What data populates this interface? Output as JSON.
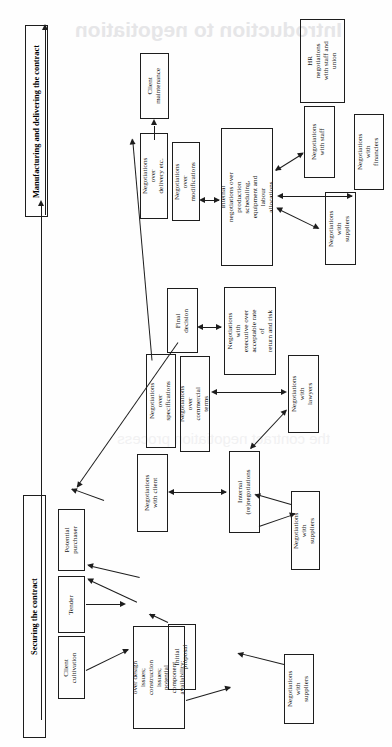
{
  "figure": {
    "orientation": "rotated-90-ccw",
    "watermark_text": "Introduction to negotiation",
    "watermark_text_2": "the contract negotiation process"
  },
  "phases": [
    {
      "id": "securing",
      "label": "Securing the contract"
    },
    {
      "id": "manufacturing",
      "label": "Manufacturing and delivering the contract"
    }
  ],
  "nodes": [
    {
      "id": "client-cultivation",
      "label": "Client\ncultivation"
    },
    {
      "id": "tender",
      "label": "Tender"
    },
    {
      "id": "potential-purchaser",
      "label": "Potential\npurchaser"
    },
    {
      "id": "initial-proposal",
      "label": "Initial\nproposal"
    },
    {
      "id": "internal-neg-design",
      "label": "Internal negotiations\nover design issues;\nconstruction issues;\npotential component\navailability;\nscheduling; price\nestimation"
    },
    {
      "id": "neg-suppliers-bottom",
      "label": "Negotiations\nwith suppliers"
    },
    {
      "id": "neg-with-client",
      "label": "Negotiations\nwith client"
    },
    {
      "id": "internal-renegotiations",
      "label": "Internal\n(re)negotiations"
    },
    {
      "id": "neg-suppliers-mid",
      "label": "Negotiations\nwith suppliers"
    },
    {
      "id": "neg-lawyers",
      "label": "Negotiations\nwith lawyers"
    },
    {
      "id": "neg-over-specifications",
      "label": "Negotiations over\nspecifications"
    },
    {
      "id": "neg-commercial-terms",
      "label": "Negotiations over\ncommercial terms"
    },
    {
      "id": "final-decision",
      "label": "Final\ndecision"
    },
    {
      "id": "neg-executive",
      "label": "Negotiations with\nexecutive over\nacceptable rate of\nreturn and risk"
    },
    {
      "id": "neg-over-delivery",
      "label": "Negotiations over\ndelivery etc."
    },
    {
      "id": "neg-over-modifications",
      "label": "Negotiations over\nmodifications"
    },
    {
      "id": "internal-neg-production",
      "label": "Internal negotiations over\nproduction scheduling,\nequipment and labour\nallocations"
    },
    {
      "id": "client-maintenance",
      "label": "Client\nmaintenance"
    },
    {
      "id": "neg-suppliers-top",
      "label": "Negotiations\nwith suppliers"
    },
    {
      "id": "neg-staff",
      "label": "Negotiations\nwith staff"
    },
    {
      "id": "hr-neg-staff-union",
      "label": "HR negotiations\nwith staff and\nunion"
    },
    {
      "id": "neg-financiers",
      "label": "Negotiations\nwith financiers"
    }
  ],
  "colors": {
    "stroke": "#1d1d1d",
    "text": "#111111",
    "background": "#ffffff",
    "watermark": "#e6e6e8"
  }
}
